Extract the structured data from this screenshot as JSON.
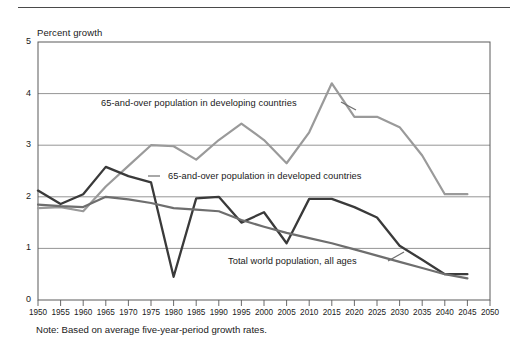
{
  "figure": {
    "y_axis_title": "Percent growth",
    "note": "Note: Based on average five-year-period growth rates."
  },
  "labels": {
    "developing": "65-and-over population in developing countries",
    "developed": "65-and-over population in developed countries",
    "world": "Total world population, all ages"
  },
  "colors": {
    "developing_line": "#9a9a9a",
    "developed_line": "#3a3a3a",
    "world_line": "#6e6e6e",
    "grid": "#7a7a7a",
    "frame": "#5a5a5a",
    "text": "#1a1a1a"
  },
  "chart_data": {
    "type": "line",
    "title": "",
    "xlabel": "",
    "ylabel": "Percent growth",
    "ylim": [
      0,
      5
    ],
    "xlim": [
      1950,
      2050
    ],
    "yticks": [
      0,
      1,
      2,
      3,
      4,
      5
    ],
    "grid": true,
    "legend_position": "inline-annotations",
    "x": [
      1950,
      1955,
      1960,
      1965,
      1970,
      1975,
      1980,
      1985,
      1990,
      1995,
      2000,
      2005,
      2010,
      2015,
      2020,
      2025,
      2030,
      2035,
      2040,
      2045,
      2050
    ],
    "categories": [
      "1950",
      "1955",
      "1960",
      "1965",
      "1970",
      "1975",
      "1980",
      "1985",
      "1990",
      "1995",
      "2000",
      "2005",
      "2010",
      "2015",
      "2020",
      "2025",
      "2030",
      "2035",
      "2040",
      "2045",
      "2050"
    ],
    "series": [
      {
        "name": "65-and-over population in developing countries",
        "color": "#9a9a9a",
        "values": [
          1.78,
          1.8,
          1.72,
          2.2,
          2.6,
          3.0,
          2.98,
          2.72,
          3.1,
          3.42,
          3.1,
          2.65,
          3.25,
          4.2,
          3.55,
          3.55,
          3.35,
          2.8,
          2.05,
          2.05,
          null
        ]
      },
      {
        "name": "65-and-over population in developed countries",
        "color": "#3a3a3a",
        "values": [
          2.12,
          1.86,
          2.05,
          2.58,
          2.4,
          2.28,
          0.45,
          1.97,
          2.0,
          1.5,
          1.7,
          1.1,
          1.96,
          1.96,
          1.8,
          1.6,
          1.05,
          0.78,
          0.5,
          0.5,
          null
        ]
      },
      {
        "name": "Total world population, all ages",
        "color": "#6e6e6e",
        "values": [
          1.85,
          1.82,
          1.8,
          2.0,
          1.95,
          1.88,
          1.78,
          1.75,
          1.72,
          1.55,
          1.42,
          1.3,
          1.2,
          1.1,
          0.98,
          0.86,
          0.74,
          0.62,
          0.5,
          0.42,
          null
        ]
      }
    ]
  }
}
